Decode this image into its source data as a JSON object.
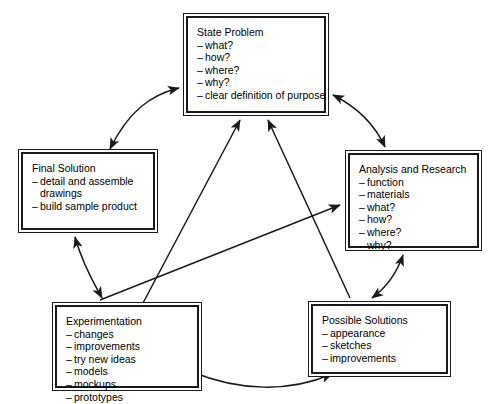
{
  "diagram": {
    "type": "flow-diagram",
    "background_color": "#ffffff",
    "line_color": "#1a1a1a",
    "nodes": [
      {
        "id": "state-problem",
        "title": "State Problem",
        "items": [
          "what?",
          "how?",
          "where?",
          "why?",
          "clear definition of purpose"
        ]
      },
      {
        "id": "final-solution",
        "title": "Final Solution",
        "items": [
          "detail and assemble",
          "drawings",
          "build sample product"
        ],
        "continuation_indices": [
          1
        ]
      },
      {
        "id": "analysis-and-research",
        "title": "Analysis and Research",
        "items": [
          "function",
          "materials",
          "what?",
          "how?",
          "where?",
          "why?"
        ]
      },
      {
        "id": "experimentation",
        "title": "Experimentation",
        "items": [
          "changes",
          "improvements",
          "try new ideas",
          "models",
          "mockups",
          "prototypes"
        ]
      },
      {
        "id": "possible-solutions",
        "title": "Possible Solutions",
        "items": [
          "appearance",
          "sketches",
          "improvements"
        ]
      }
    ],
    "connectors": [
      {
        "id": "final-solution--state-problem",
        "from": "final-solution",
        "to": "state-problem",
        "style": "curved",
        "heads": "both"
      },
      {
        "id": "state-problem--analysis",
        "from": "state-problem",
        "to": "analysis-and-research",
        "style": "curved",
        "heads": "both"
      },
      {
        "id": "final-solution--experimentation",
        "from": "final-solution",
        "to": "experimentation",
        "style": "curved",
        "heads": "both"
      },
      {
        "id": "analysis--possible-solutions",
        "from": "analysis-and-research",
        "to": "possible-solutions",
        "style": "curved",
        "heads": "both"
      },
      {
        "id": "experimentation--possible-solutions",
        "from": "experimentation",
        "to": "possible-solutions",
        "style": "curved",
        "heads": "both"
      },
      {
        "id": "experimentation--state-problem",
        "from": "experimentation",
        "to": "state-problem",
        "style": "straight",
        "heads": "end"
      },
      {
        "id": "possible-solutions--state-problem",
        "from": "possible-solutions",
        "to": "state-problem",
        "style": "straight",
        "heads": "end"
      },
      {
        "id": "experimentation--analysis",
        "from": "experimentation",
        "to": "analysis-and-research",
        "style": "straight",
        "heads": "end"
      }
    ]
  }
}
